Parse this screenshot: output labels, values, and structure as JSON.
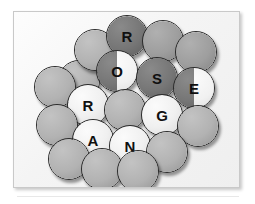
{
  "card": {
    "background_color": "#f6f6f6",
    "border_color": "#c9c9c9",
    "page_background": "#ffffff"
  },
  "palette": {
    "light": "#f0f0f0",
    "mid": "#b2b2b2",
    "mid_dark": "#9e9e9e",
    "dark": "#767676",
    "outline": "#2b2b2b",
    "glyph": "#101010"
  },
  "puzzle": {
    "title": "",
    "words": [
      {
        "name": "rose",
        "text": "ROSE",
        "tone": "dark",
        "letters": [
          "R",
          "O",
          "S",
          "E"
        ]
      },
      {
        "name": "orange",
        "text": "ORANGE",
        "tone": "light",
        "letters": [
          "O",
          "R",
          "A",
          "N",
          "G",
          "E"
        ]
      }
    ],
    "disc_count": 20,
    "lettered_disc_count": 7
  },
  "discs": [
    {
      "id": "disc-1",
      "label": "",
      "tone": "mid",
      "x": 44,
      "y": 48,
      "d": 42
    },
    {
      "id": "disc-2",
      "label": "",
      "tone": "mid",
      "x": 60,
      "y": 17,
      "d": 42
    },
    {
      "id": "disc-3",
      "label": "R",
      "tone": "dark",
      "x": 92,
      "y": 3,
      "d": 42,
      "word": "rose",
      "index": 0
    },
    {
      "id": "disc-4",
      "label": "",
      "tone": "mid-dark",
      "x": 128,
      "y": 8,
      "d": 42
    },
    {
      "id": "disc-5",
      "label": "",
      "tone": "mid-dark",
      "x": 161,
      "y": 19,
      "d": 42
    },
    {
      "id": "disc-6",
      "label": "O",
      "tone": "split",
      "x": 82,
      "y": 38,
      "d": 42,
      "word": "rose",
      "index": 1
    },
    {
      "id": "disc-7",
      "label": "S",
      "tone": "dark",
      "x": 122,
      "y": 45,
      "d": 42,
      "word": "rose",
      "index": 2
    },
    {
      "id": "disc-8",
      "label": "E",
      "tone": "split",
      "x": 159,
      "y": 55,
      "d": 42,
      "word": "rose",
      "index": 3
    },
    {
      "id": "disc-9",
      "label": "",
      "tone": "mid",
      "x": 20,
      "y": 54,
      "d": 42
    },
    {
      "id": "disc-10",
      "label": "R",
      "tone": "light",
      "x": 53,
      "y": 72,
      "d": 42,
      "word": "orange",
      "index": 1
    },
    {
      "id": "disc-11",
      "label": "",
      "tone": "mid",
      "x": 90,
      "y": 77,
      "d": 42
    },
    {
      "id": "disc-12",
      "label": "G",
      "tone": "light",
      "x": 127,
      "y": 82,
      "d": 42,
      "word": "orange",
      "index": 4
    },
    {
      "id": "disc-13",
      "label": "",
      "tone": "mid",
      "x": 163,
      "y": 93,
      "d": 42
    },
    {
      "id": "disc-14",
      "label": "",
      "tone": "mid",
      "x": 22,
      "y": 92,
      "d": 42
    },
    {
      "id": "disc-15",
      "label": "A",
      "tone": "light",
      "x": 58,
      "y": 107,
      "d": 42,
      "word": "orange",
      "index": 2
    },
    {
      "id": "disc-16",
      "label": "N",
      "tone": "light",
      "x": 95,
      "y": 113,
      "d": 42,
      "word": "orange",
      "index": 3
    },
    {
      "id": "disc-17",
      "label": "",
      "tone": "mid",
      "x": 132,
      "y": 119,
      "d": 42
    },
    {
      "id": "disc-18",
      "label": "",
      "tone": "mid",
      "x": 34,
      "y": 126,
      "d": 42
    },
    {
      "id": "disc-19",
      "label": "",
      "tone": "mid",
      "x": 67,
      "y": 136,
      "d": 42
    },
    {
      "id": "disc-20",
      "label": "",
      "tone": "mid",
      "x": 103,
      "y": 138,
      "d": 42
    }
  ]
}
